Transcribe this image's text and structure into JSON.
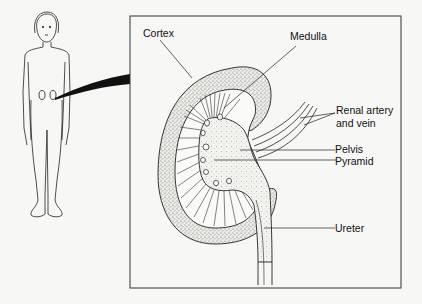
{
  "figure": {
    "type": "anatomical-diagram",
    "colors": {
      "background": "#f7f7f5",
      "line": "#222222",
      "stipple_fill": "#d6d6d2",
      "wedge": "#111111"
    }
  },
  "labels": {
    "cortex": "Cortex",
    "medulla": "Medulla",
    "renal_line1": "Renal artery",
    "renal_line2": "and vein",
    "pelvis": "Pelvis",
    "pyramid": "Pyramid",
    "ureter": "Ureter"
  }
}
